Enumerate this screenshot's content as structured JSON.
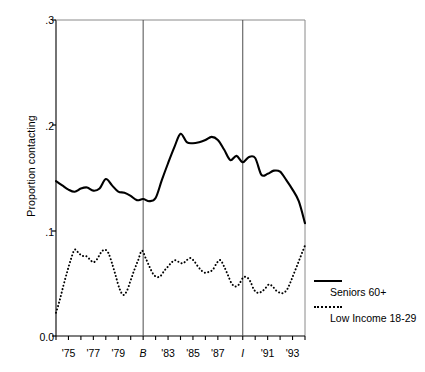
{
  "chart_data": {
    "type": "line",
    "title": "",
    "xlabel": "",
    "ylabel": "Proportion contacting",
    "ylim": [
      0.0,
      0.3
    ],
    "yticks": [
      0.0,
      0.1,
      0.2,
      0.3
    ],
    "ytick_labels": [
      "0.0",
      ".1",
      ".2",
      ".3"
    ],
    "xlim": [
      1974,
      1994
    ],
    "xtick_years": [
      1975,
      1977,
      1979,
      1981,
      1983,
      1985,
      1987,
      1989,
      1991,
      1993
    ],
    "xtick_labels": [
      "'75",
      "'77",
      "'79",
      "B",
      "'83",
      "'85",
      "'87",
      "I",
      "'91",
      "'93"
    ],
    "grid": false,
    "legend_position": "right",
    "annotations": [
      {
        "name": "vertical-line-B",
        "label": "B",
        "x": 1981
      },
      {
        "name": "vertical-line-I",
        "label": "I",
        "x": 1989
      }
    ],
    "series": [
      {
        "name": "Seniors 60+",
        "style": "solid",
        "color": "#000000",
        "x": [
          1974.0,
          1974.5,
          1975.0,
          1975.5,
          1976.0,
          1976.5,
          1977.0,
          1977.5,
          1978.0,
          1978.5,
          1979.0,
          1979.5,
          1980.0,
          1980.5,
          1981.0,
          1981.5,
          1982.0,
          1982.5,
          1983.0,
          1983.5,
          1984.0,
          1984.5,
          1985.0,
          1985.5,
          1986.0,
          1986.5,
          1987.0,
          1987.5,
          1988.0,
          1988.5,
          1989.0,
          1989.5,
          1990.0,
          1990.5,
          1991.0,
          1991.5,
          1992.0,
          1992.5,
          1993.0,
          1993.5,
          1994.0
        ],
        "values": [
          0.147,
          0.143,
          0.139,
          0.137,
          0.14,
          0.141,
          0.138,
          0.14,
          0.149,
          0.143,
          0.137,
          0.136,
          0.133,
          0.129,
          0.13,
          0.128,
          0.131,
          0.148,
          0.164,
          0.179,
          0.192,
          0.184,
          0.183,
          0.184,
          0.186,
          0.189,
          0.186,
          0.177,
          0.167,
          0.171,
          0.165,
          0.17,
          0.169,
          0.153,
          0.154,
          0.157,
          0.156,
          0.148,
          0.139,
          0.128,
          0.107
        ]
      },
      {
        "name": "Low Income 18-29",
        "style": "dotted",
        "color": "#000000",
        "x": [
          1974.0,
          1974.3,
          1974.6,
          1974.9,
          1975.2,
          1975.5,
          1975.8,
          1976.1,
          1976.4,
          1976.7,
          1977.0,
          1977.3,
          1977.6,
          1977.9,
          1978.2,
          1978.5,
          1978.8,
          1979.1,
          1979.4,
          1979.7,
          1980.0,
          1980.3,
          1980.6,
          1980.9,
          1981.2,
          1981.5,
          1981.8,
          1982.1,
          1982.4,
          1982.7,
          1983.0,
          1983.3,
          1983.6,
          1983.9,
          1984.2,
          1984.5,
          1984.8,
          1985.1,
          1985.4,
          1985.7,
          1986.0,
          1986.3,
          1986.6,
          1986.9,
          1987.2,
          1987.5,
          1987.8,
          1988.1,
          1988.4,
          1988.7,
          1989.0,
          1989.3,
          1989.6,
          1989.9,
          1990.2,
          1990.5,
          1990.8,
          1991.1,
          1991.4,
          1991.7,
          1992.0,
          1992.3,
          1992.6,
          1992.9,
          1993.2,
          1993.5,
          1993.8,
          1994.0
        ],
        "values": [
          0.022,
          0.034,
          0.048,
          0.061,
          0.073,
          0.082,
          0.079,
          0.076,
          0.076,
          0.073,
          0.07,
          0.073,
          0.079,
          0.082,
          0.079,
          0.069,
          0.057,
          0.045,
          0.039,
          0.043,
          0.053,
          0.063,
          0.072,
          0.081,
          0.074,
          0.066,
          0.059,
          0.056,
          0.057,
          0.062,
          0.066,
          0.07,
          0.072,
          0.07,
          0.069,
          0.072,
          0.074,
          0.071,
          0.066,
          0.062,
          0.06,
          0.061,
          0.063,
          0.069,
          0.072,
          0.066,
          0.058,
          0.05,
          0.047,
          0.049,
          0.055,
          0.056,
          0.052,
          0.044,
          0.041,
          0.042,
          0.045,
          0.049,
          0.047,
          0.043,
          0.041,
          0.041,
          0.045,
          0.053,
          0.062,
          0.071,
          0.08,
          0.086
        ]
      }
    ]
  },
  "axis": {
    "y_title": "Proportion contacting",
    "y_tick_labels": [
      "0.0",
      ".1",
      ".2",
      ".3"
    ],
    "x_tick_labels": [
      "'75",
      "'77",
      "'79",
      "B",
      "'83",
      "'85",
      "'87",
      "I",
      "'91",
      "'93"
    ]
  },
  "legend": {
    "entries": [
      {
        "label": "Seniors 60+",
        "style": "solid"
      },
      {
        "label": "Low Income 18-29",
        "style": "dotted"
      }
    ]
  },
  "colors": {
    "line": "#000000",
    "axis": "#000000",
    "vline": "#4d4d4d",
    "background": "#ffffff"
  }
}
